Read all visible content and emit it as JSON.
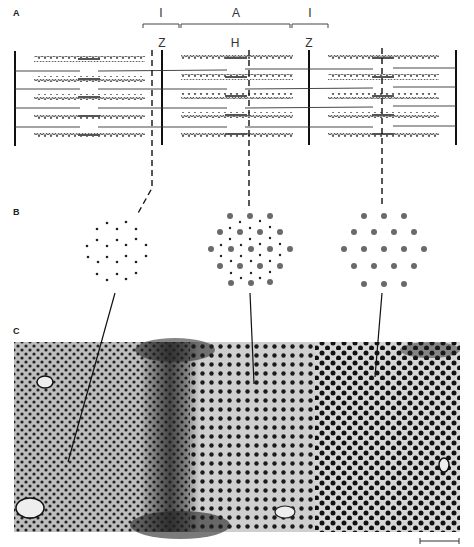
{
  "figure": {
    "panels": {
      "a": {
        "label": "A"
      },
      "b": {
        "label": "B"
      },
      "c": {
        "label": "C"
      }
    },
    "bands": {
      "i_left": "I",
      "a_band": "A",
      "i_right": "I",
      "z_left": "Z",
      "h_zone": "H",
      "z_right": "Z"
    },
    "cross_sections": [
      {
        "region": "I band (thin filaments only)",
        "pattern": "small dots"
      },
      {
        "region": "A band overlap (thick + thin)",
        "pattern": "large and small dots"
      },
      {
        "region": "H zone (thick filaments only)",
        "pattern": "large dots"
      }
    ],
    "scale_bar": {
      "present": true
    },
    "colors": {
      "filament": "#555555",
      "thick_dot": "#6a6a6a",
      "line": "#111111"
    }
  }
}
